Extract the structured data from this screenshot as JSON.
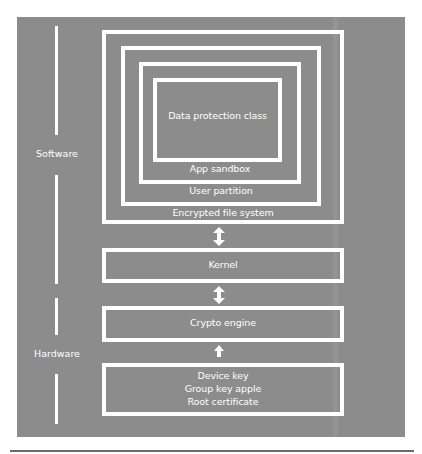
{
  "diagram": {
    "side_labels": {
      "software": "Software",
      "hardware": "Hardware"
    },
    "nested_layers": {
      "innermost": "Data protection class",
      "level3": "App sandbox",
      "level2": "User partition",
      "level1": "Encrypted file system"
    },
    "stack": {
      "kernel": "Kernel",
      "crypto": "Crypto engine",
      "keys": [
        "Device key",
        "Group key apple",
        "Root certificate"
      ]
    },
    "arrows": [
      "bidirectional",
      "bidirectional",
      "up"
    ],
    "colors": {
      "background": "#8c8c8c",
      "lines": "#ffffff"
    }
  }
}
